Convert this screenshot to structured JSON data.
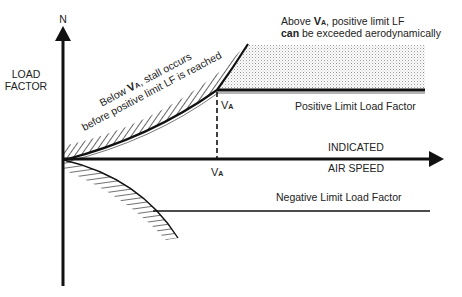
{
  "axes": {
    "y_axis_letter": "N",
    "y_axis_label_line1": "LOAD",
    "y_axis_label_line2": "FACTOR",
    "x_axis_label_line1": "INDICATED",
    "x_axis_label_line2": "AIR SPEED"
  },
  "markers": {
    "va_main": "V",
    "va_sub": "A",
    "va_axis_main": "V",
    "va_axis_sub": "A"
  },
  "annotations": {
    "below_va_line1_pre": "Below ",
    "below_va_line1_v": "V",
    "below_va_line1_sub": "A",
    "below_va_line1_post": ", stall occurs",
    "below_va_line2": "before positive limit LF is reached",
    "above_va_line1_pre": "Above ",
    "above_va_line1_v": "V",
    "above_va_line1_sub": "A",
    "above_va_line1_post": ", positive limit LF",
    "above_va_line2_bold": "can",
    "above_va_line2_rest": " be exceeded aerodynamically"
  },
  "lines": {
    "positive_limit_label": "Positive Limit Load Factor",
    "negative_limit_label": "Negative Limit Load Factor"
  },
  "colors": {
    "ink": "#111111",
    "text": "#222222",
    "stipple": "#9a9a9a"
  }
}
